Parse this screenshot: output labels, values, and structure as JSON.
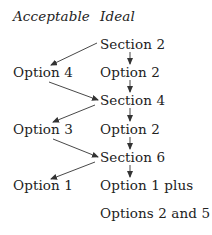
{
  "headers": {
    "acceptable": "Acceptable",
    "ideal": "Ideal"
  },
  "acceptable_column": [
    "Option 4",
    "Option 3",
    "Option 1"
  ],
  "ideal_column": [
    "Section 2",
    "Option 2",
    "Section 4",
    "Option 2",
    "Section 6",
    "Option 1 plus",
    "Options 2 and 5"
  ],
  "edges": [
    {
      "from": "Section 2",
      "to": "Option 4"
    },
    {
      "from": "Section 2",
      "to": "Option 2"
    },
    {
      "from": "Option 4",
      "to": "Section 4"
    },
    {
      "from": "Option 2",
      "to": "Section 4"
    },
    {
      "from": "Section 4",
      "to": "Option 3"
    },
    {
      "from": "Section 4",
      "to": "Option 2"
    },
    {
      "from": "Option 3",
      "to": "Section 6"
    },
    {
      "from": "Option 2",
      "to": "Section 6"
    },
    {
      "from": "Section 6",
      "to": "Option 1"
    },
    {
      "from": "Section 6",
      "to": "Option 1 plus"
    }
  ],
  "colors": {
    "text": "#222222",
    "arrow": "#333333",
    "background": "#ffffff"
  }
}
